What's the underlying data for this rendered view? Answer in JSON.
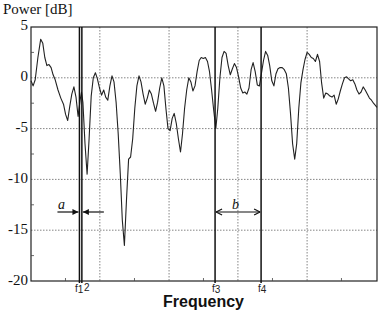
{
  "chart_data": {
    "type": "line",
    "title": "",
    "ylabel": "Power [dB]",
    "xlabel": "Frequency",
    "ylim": [
      -20,
      5
    ],
    "yticks": [
      "5",
      "0",
      "-5",
      "-10",
      "-15",
      "-20"
    ],
    "grid": true,
    "legend": null,
    "x_range_normalized": [
      0,
      1
    ],
    "series": [
      {
        "name": "Power spectrum",
        "color": "#222222",
        "points": [
          [
            0.0,
            -0.3
          ],
          [
            0.006,
            -0.8
          ],
          [
            0.012,
            -0.2
          ],
          [
            0.02,
            2.0
          ],
          [
            0.028,
            3.8
          ],
          [
            0.034,
            3.4
          ],
          [
            0.04,
            2.0
          ],
          [
            0.046,
            1.2
          ],
          [
            0.052,
            1.3
          ],
          [
            0.058,
            1.0
          ],
          [
            0.064,
            0.3
          ],
          [
            0.07,
            -0.2
          ],
          [
            0.078,
            -1.2
          ],
          [
            0.086,
            -2.0
          ],
          [
            0.094,
            -2.6
          ],
          [
            0.1,
            -3.6
          ],
          [
            0.106,
            -4.2
          ],
          [
            0.112,
            -2.8
          ],
          [
            0.118,
            -1.6
          ],
          [
            0.124,
            -0.9
          ],
          [
            0.13,
            -1.9
          ],
          [
            0.136,
            -3.8
          ],
          [
            0.142,
            -2.2
          ],
          [
            0.146,
            -1.4
          ],
          [
            0.15,
            -2.4
          ],
          [
            0.156,
            -6.5
          ],
          [
            0.162,
            -9.5
          ],
          [
            0.168,
            -6.0
          ],
          [
            0.174,
            -1.8
          ],
          [
            0.18,
            0.0
          ],
          [
            0.186,
            0.5
          ],
          [
            0.192,
            -0.1
          ],
          [
            0.198,
            -1.0
          ],
          [
            0.204,
            -1.7
          ],
          [
            0.21,
            -1.2
          ],
          [
            0.216,
            -1.9
          ],
          [
            0.222,
            -2.2
          ],
          [
            0.228,
            -0.8
          ],
          [
            0.234,
            0.2
          ],
          [
            0.24,
            -0.4
          ],
          [
            0.246,
            -2.4
          ],
          [
            0.252,
            -5.5
          ],
          [
            0.258,
            -9.5
          ],
          [
            0.264,
            -14.0
          ],
          [
            0.27,
            -16.5
          ],
          [
            0.276,
            -12.0
          ],
          [
            0.282,
            -8.0
          ],
          [
            0.288,
            -7.8
          ],
          [
            0.294,
            -6.0
          ],
          [
            0.3,
            -3.0
          ],
          [
            0.306,
            -0.8
          ],
          [
            0.312,
            0.2
          ],
          [
            0.318,
            -0.4
          ],
          [
            0.324,
            -1.6
          ],
          [
            0.33,
            -2.6
          ],
          [
            0.336,
            -2.0
          ],
          [
            0.342,
            -1.2
          ],
          [
            0.348,
            -1.6
          ],
          [
            0.354,
            -2.5
          ],
          [
            0.36,
            -3.3
          ],
          [
            0.366,
            -2.4
          ],
          [
            0.372,
            -1.0
          ],
          [
            0.378,
            0.0
          ],
          [
            0.384,
            -0.8
          ],
          [
            0.39,
            -3.0
          ],
          [
            0.396,
            -5.0
          ],
          [
            0.402,
            -5.2
          ],
          [
            0.408,
            -4.0
          ],
          [
            0.414,
            -3.5
          ],
          [
            0.42,
            -4.5
          ],
          [
            0.426,
            -6.0
          ],
          [
            0.432,
            -7.3
          ],
          [
            0.438,
            -5.5
          ],
          [
            0.444,
            -3.0
          ],
          [
            0.45,
            -1.2
          ],
          [
            0.456,
            0.0
          ],
          [
            0.462,
            -0.4
          ],
          [
            0.468,
            -1.3
          ],
          [
            0.474,
            -0.8
          ],
          [
            0.48,
            0.6
          ],
          [
            0.486,
            1.7
          ],
          [
            0.492,
            2.0
          ],
          [
            0.498,
            1.9
          ],
          [
            0.504,
            2.0
          ],
          [
            0.51,
            1.6
          ],
          [
            0.516,
            0.6
          ],
          [
            0.522,
            -1.2
          ],
          [
            0.528,
            -3.2
          ],
          [
            0.534,
            -5.0
          ],
          [
            0.54,
            -3.0
          ],
          [
            0.546,
            0.0
          ],
          [
            0.552,
            2.0
          ],
          [
            0.558,
            2.6
          ],
          [
            0.564,
            2.4
          ],
          [
            0.57,
            1.2
          ],
          [
            0.576,
            0.3
          ],
          [
            0.582,
            0.9
          ],
          [
            0.588,
            1.4
          ],
          [
            0.594,
            1.0
          ],
          [
            0.6,
            0.1
          ],
          [
            0.606,
            -1.0
          ],
          [
            0.612,
            -1.5
          ],
          [
            0.618,
            -1.4
          ],
          [
            0.624,
            -1.6
          ],
          [
            0.63,
            -1.0
          ],
          [
            0.636,
            0.8
          ],
          [
            0.642,
            1.5
          ],
          [
            0.648,
            0.6
          ],
          [
            0.654,
            -0.7
          ],
          [
            0.66,
            -0.8
          ],
          [
            0.666,
            0.4
          ],
          [
            0.672,
            1.7
          ],
          [
            0.678,
            2.6
          ],
          [
            0.684,
            2.2
          ],
          [
            0.69,
            1.2
          ],
          [
            0.696,
            -0.3
          ],
          [
            0.702,
            -0.8
          ],
          [
            0.708,
            0.4
          ],
          [
            0.714,
            0.9
          ],
          [
            0.72,
            1.0
          ],
          [
            0.726,
            1.0
          ],
          [
            0.732,
            0.8
          ],
          [
            0.738,
            0.4
          ],
          [
            0.744,
            -1.0
          ],
          [
            0.75,
            -3.5
          ],
          [
            0.756,
            -6.5
          ],
          [
            0.762,
            -8.0
          ],
          [
            0.768,
            -6.5
          ],
          [
            0.774,
            -3.0
          ],
          [
            0.78,
            -0.5
          ],
          [
            0.786,
            0.8
          ],
          [
            0.792,
            1.8
          ],
          [
            0.798,
            2.5
          ],
          [
            0.804,
            2.3
          ],
          [
            0.81,
            2.0
          ],
          [
            0.816,
            1.9
          ],
          [
            0.822,
            1.6
          ],
          [
            0.828,
            2.3
          ],
          [
            0.834,
            1.6
          ],
          [
            0.84,
            -0.5
          ],
          [
            0.846,
            -2.0
          ],
          [
            0.852,
            -1.5
          ],
          [
            0.858,
            -1.6
          ],
          [
            0.864,
            -1.8
          ],
          [
            0.87,
            -1.9
          ],
          [
            0.876,
            -1.7
          ],
          [
            0.882,
            -2.6
          ],
          [
            0.888,
            -2.1
          ],
          [
            0.894,
            -1.3
          ],
          [
            0.9,
            -0.6
          ],
          [
            0.906,
            0.0
          ],
          [
            0.912,
            0.1
          ],
          [
            0.918,
            -0.1
          ],
          [
            0.924,
            -0.3
          ],
          [
            0.93,
            -0.2
          ],
          [
            0.936,
            -0.6
          ],
          [
            0.942,
            -1.2
          ],
          [
            0.948,
            -1.6
          ],
          [
            0.954,
            -1.4
          ],
          [
            0.96,
            -0.9
          ],
          [
            0.966,
            -1.2
          ],
          [
            0.972,
            -1.6
          ],
          [
            0.978,
            -2.0
          ],
          [
            0.984,
            -2.2
          ],
          [
            0.99,
            -2.5
          ],
          [
            1.0,
            -2.9
          ]
        ]
      }
    ],
    "vertical_markers": [
      {
        "label": "f1",
        "sub": "1",
        "x": 0.14
      },
      {
        "label": "f2",
        "sub": "2",
        "x": 0.147
      },
      {
        "label": "f3",
        "sub": "3",
        "x": 0.532
      },
      {
        "label": "f4",
        "sub": "4",
        "x": 0.665
      }
    ],
    "vertical_gridlines_x": [
      0.199,
      0.399,
      0.598,
      0.798
    ],
    "annotations": [
      {
        "text": "a",
        "meaning": "narrow spacing between f1 and f2 (arrows pointing inward)"
      },
      {
        "text": "b",
        "meaning": "spacing between f3 and f4 (double-headed arrow)"
      }
    ]
  },
  "labels": {
    "ylabel": "Power [dB]",
    "xlabel": "Frequency",
    "ann_a": "a",
    "ann_b": "b",
    "f_letter": "f",
    "f1_sub": "1",
    "f2_sub": "2",
    "f3_sub": "3",
    "f4_sub": "4"
  }
}
